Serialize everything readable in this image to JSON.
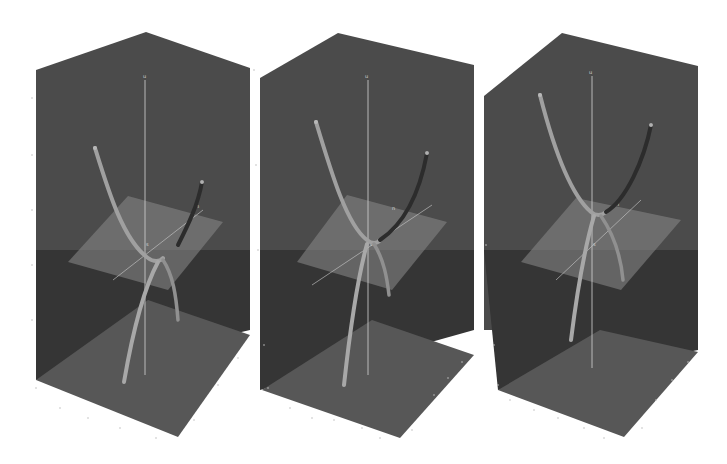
{
  "figure": {
    "colors": {
      "background": "#ffffff",
      "box_back_wall": "#4a4a4a",
      "box_side_wall": "#3c3c3c",
      "box_floor": "#555555",
      "plane": "#7a7a7a",
      "tube": "#9a9a9a",
      "axis_line": "#d0d0d0"
    },
    "panels": [
      {
        "id": "left",
        "axis_label_top": "u",
        "axis_label_plane": "n",
        "axis_label_center": "s",
        "description": "Two branches separated; curves meet below plane"
      },
      {
        "id": "middle",
        "axis_label_top": "u",
        "axis_label_plane": "n",
        "axis_label_center": "s",
        "description": "Branches touching at the plane (transition)"
      },
      {
        "id": "right",
        "axis_label_top": "u",
        "axis_label_plane": "n",
        "axis_label_center": "s",
        "description": "Branches joined above plane"
      }
    ]
  }
}
